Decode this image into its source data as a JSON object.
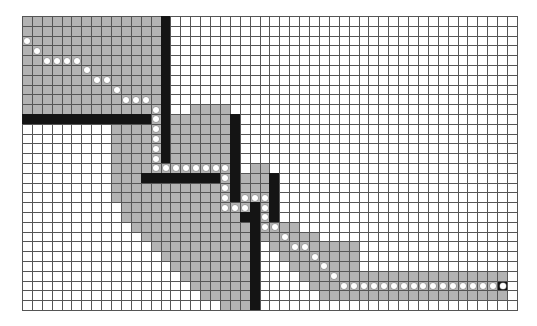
{
  "grid": {
    "cols": 50,
    "rows": 30,
    "colors": {
      "empty": "#ffffff",
      "visited": "#b3b3b3",
      "wall": "#141414",
      "path_dot": "#ffffff",
      "grid_line": "#555555"
    },
    "visited_ranges": [
      {
        "rows": [
          0,
          9
        ],
        "cols": [
          0,
          13
        ]
      },
      {
        "rows": [
          9,
          9
        ],
        "cols": [
          17,
          20
        ]
      },
      {
        "rows": [
          10,
          10
        ],
        "cols": [
          13,
          13
        ]
      },
      {
        "rows": [
          10,
          14
        ],
        "cols": [
          15,
          20
        ]
      },
      {
        "rows": [
          11,
          18
        ],
        "cols": [
          9,
          13
        ]
      },
      {
        "rows": [
          15,
          15
        ],
        "cols": [
          9,
          20
        ]
      },
      {
        "rows": [
          15,
          15
        ],
        "cols": [
          23,
          24
        ]
      },
      {
        "rows": [
          16,
          18
        ],
        "cols": [
          20,
          20
        ]
      },
      {
        "rows": [
          17,
          18
        ],
        "cols": [
          14,
          19
        ]
      },
      {
        "rows": [
          16,
          18
        ],
        "cols": [
          22,
          24
        ]
      },
      {
        "rows": [
          19,
          19
        ],
        "cols": [
          10,
          22
        ]
      },
      {
        "rows": [
          19,
          20
        ],
        "cols": [
          24,
          24
        ]
      },
      {
        "rows": [
          20,
          20
        ],
        "cols": [
          10,
          21
        ]
      },
      {
        "rows": [
          21,
          21
        ],
        "cols": [
          11,
          22
        ]
      },
      {
        "rows": [
          21,
          21
        ],
        "cols": [
          24,
          27
        ]
      },
      {
        "rows": [
          22,
          22
        ],
        "cols": [
          12,
          22
        ]
      },
      {
        "rows": [
          22,
          22
        ],
        "cols": [
          24,
          29
        ]
      },
      {
        "rows": [
          23,
          23
        ],
        "cols": [
          13,
          22
        ]
      },
      {
        "rows": [
          23,
          23
        ],
        "cols": [
          25,
          33
        ]
      },
      {
        "rows": [
          24,
          24
        ],
        "cols": [
          14,
          22
        ]
      },
      {
        "rows": [
          24,
          24
        ],
        "cols": [
          26,
          33
        ]
      },
      {
        "rows": [
          25,
          25
        ],
        "cols": [
          15,
          22
        ]
      },
      {
        "rows": [
          25,
          25
        ],
        "cols": [
          27,
          33
        ]
      },
      {
        "rows": [
          26,
          26
        ],
        "cols": [
          16,
          22
        ]
      },
      {
        "rows": [
          26,
          26
        ],
        "cols": [
          28,
          48
        ]
      },
      {
        "rows": [
          27,
          27
        ],
        "cols": [
          17,
          22
        ]
      },
      {
        "rows": [
          27,
          27
        ],
        "cols": [
          29,
          48
        ]
      },
      {
        "rows": [
          28,
          28
        ],
        "cols": [
          18,
          22
        ]
      },
      {
        "rows": [
          28,
          28
        ],
        "cols": [
          30,
          48
        ]
      },
      {
        "rows": [
          29,
          29
        ],
        "cols": [
          20,
          22
        ]
      }
    ],
    "walls": [
      {
        "rows": [
          0,
          14
        ],
        "cols": [
          14,
          14
        ]
      },
      {
        "rows": [
          10,
          10
        ],
        "cols": [
          0,
          12
        ]
      },
      {
        "rows": [
          16,
          16
        ],
        "cols": [
          12,
          19
        ]
      },
      {
        "rows": [
          10,
          18
        ],
        "cols": [
          21,
          21
        ]
      },
      {
        "rows": [
          16,
          20
        ],
        "cols": [
          25,
          25
        ]
      },
      {
        "rows": [
          19,
          29
        ],
        "cols": [
          23,
          23
        ]
      },
      {
        "rows": [
          20,
          20
        ],
        "cols": [
          22,
          22
        ]
      }
    ],
    "path": [
      [
        0,
        2
      ],
      [
        1,
        3
      ],
      [
        2,
        4
      ],
      [
        3,
        4
      ],
      [
        4,
        4
      ],
      [
        5,
        4
      ],
      [
        6,
        5
      ],
      [
        7,
        6
      ],
      [
        8,
        6
      ],
      [
        9,
        7
      ],
      [
        10,
        8
      ],
      [
        11,
        8
      ],
      [
        12,
        8
      ],
      [
        13,
        9
      ],
      [
        13,
        10
      ],
      [
        13,
        11
      ],
      [
        13,
        12
      ],
      [
        13,
        13
      ],
      [
        13,
        14
      ],
      [
        13,
        15
      ],
      [
        14,
        15
      ],
      [
        15,
        15
      ],
      [
        16,
        15
      ],
      [
        17,
        15
      ],
      [
        18,
        15
      ],
      [
        19,
        15
      ],
      [
        20,
        15
      ],
      [
        20,
        16
      ],
      [
        20,
        17
      ],
      [
        20,
        18
      ],
      [
        20,
        19
      ],
      [
        21,
        19
      ],
      [
        22,
        19
      ],
      [
        22,
        18
      ],
      [
        23,
        18
      ],
      [
        24,
        18
      ],
      [
        24,
        19
      ],
      [
        24,
        20
      ],
      [
        24,
        21
      ],
      [
        25,
        21
      ],
      [
        26,
        22
      ],
      [
        27,
        23
      ],
      [
        28,
        23
      ],
      [
        29,
        24
      ],
      [
        30,
        25
      ],
      [
        31,
        26
      ],
      [
        32,
        27
      ],
      [
        33,
        27
      ],
      [
        34,
        27
      ],
      [
        35,
        27
      ],
      [
        36,
        27
      ],
      [
        37,
        27
      ],
      [
        38,
        27
      ],
      [
        39,
        27
      ],
      [
        40,
        27
      ],
      [
        41,
        27
      ],
      [
        42,
        27
      ],
      [
        43,
        27
      ],
      [
        44,
        27
      ],
      [
        45,
        27
      ],
      [
        46,
        27
      ],
      [
        47,
        27
      ]
    ],
    "start": [
      0,
      2
    ],
    "goal": [
      48,
      27
    ]
  }
}
